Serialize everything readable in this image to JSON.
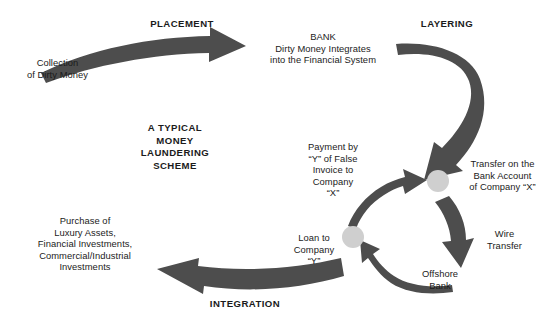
{
  "diagram": {
    "title": "A TYPICAL\nMONEY\nLAUNDERING\nSCHEME",
    "stage_labels": {
      "placement": "PLACEMENT",
      "layering": "LAYERING",
      "integration": "INTEGRATION"
    },
    "nodes": [
      {
        "id": "collection",
        "text": "Collection\nof Dirty Money"
      },
      {
        "id": "bank",
        "text": "BANK\nDirty Money Integrates\ninto the Financial System"
      },
      {
        "id": "transfer",
        "text": "Transfer on the\nBank Account\nof Company “X”"
      },
      {
        "id": "wire-transfer",
        "text": "Wire\nTransfer"
      },
      {
        "id": "offshore-bank",
        "text": "Offshore\nBank"
      },
      {
        "id": "loan",
        "text": "Loan to\nCompany\n“Y”"
      },
      {
        "id": "payment",
        "text": "Payment by\n“Y” of False\nInvoice to\nCompany\n“X”"
      },
      {
        "id": "purchase",
        "text": "Purchase of\nLuxury Assets,\nFinancial Investments,\nCommercial/Industrial\nInvestments"
      }
    ],
    "colors": {
      "arrow": "#4d4d4d",
      "arrow_dark": "#3f3f3f",
      "node_dot": "#cfcfcf",
      "text": "#1b1b1b",
      "background": "#ffffff"
    }
  }
}
